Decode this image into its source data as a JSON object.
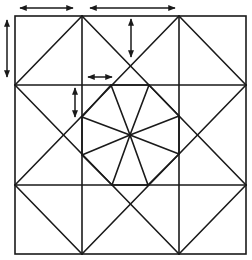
{
  "diagram": {
    "stroke_color": "#1a1a1a",
    "background_color": "#ffffff",
    "outer_square": {
      "x1": 15,
      "y1": 16,
      "x2": 246,
      "y2": 254
    },
    "grid_lines": {
      "vertical_x": [
        82,
        179
      ],
      "horizontal_y": [
        85,
        185
      ]
    },
    "diagonals": [
      [
        82,
        16,
        246,
        185
      ],
      [
        179,
        16,
        15,
        185
      ],
      [
        15,
        85,
        179,
        254
      ],
      [
        246,
        85,
        82,
        254
      ],
      [
        82,
        16,
        15,
        85
      ],
      [
        179,
        16,
        246,
        85
      ],
      [
        15,
        185,
        82,
        254
      ],
      [
        246,
        185,
        179,
        254
      ]
    ],
    "center": [
      130,
      135
    ],
    "octagon_vertices": [
      [
        111,
        85
      ],
      [
        149,
        85
      ],
      [
        179,
        116
      ],
      [
        179,
        154
      ],
      [
        148,
        185
      ],
      [
        112,
        185
      ],
      [
        82,
        155
      ],
      [
        82,
        117
      ]
    ],
    "arrows": [
      {
        "name": "top-left-width-arrow",
        "orientation": "horizontal",
        "x1": 20,
        "y1": 8,
        "x2": 73,
        "y2": 8
      },
      {
        "name": "top-center-width-arrow",
        "orientation": "horizontal",
        "x1": 90,
        "y1": 8,
        "x2": 175,
        "y2": 8
      },
      {
        "name": "left-height-arrow",
        "orientation": "vertical",
        "x1": 7,
        "y1": 20,
        "x2": 7,
        "y2": 77
      },
      {
        "name": "upper-center-height-arrow",
        "orientation": "vertical",
        "x1": 131,
        "y1": 19,
        "x2": 131,
        "y2": 57
      },
      {
        "name": "small-horizontal-arrow",
        "orientation": "horizontal",
        "x1": 88,
        "y1": 77,
        "x2": 112,
        "y2": 77
      },
      {
        "name": "small-vertical-arrow",
        "orientation": "vertical",
        "x1": 75,
        "y1": 88,
        "x2": 75,
        "y2": 117
      }
    ]
  }
}
